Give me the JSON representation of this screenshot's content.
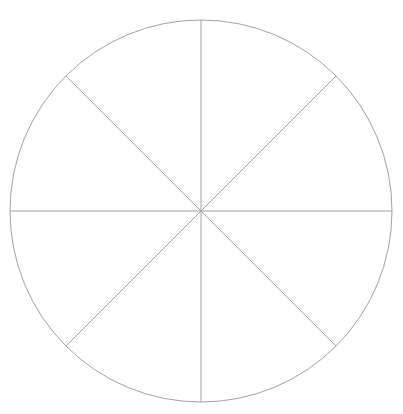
{
  "figure": {
    "name": "circle-eight-sectors",
    "caption_clipped": "Fig. 10.4   Eight equal sectors",
    "background_color": "#ffffff",
    "stroke_color": "#a2a2a8",
    "stroke_width": 1,
    "canvas": {
      "width": 403,
      "height": 414
    },
    "circle": {
      "label": "outer-circle",
      "center_x": 201,
      "center_y": 211,
      "radius": 191
    },
    "sector_count": 8,
    "sector_angle_degrees": 45,
    "diameters": [
      {
        "label": "vertical-diameter",
        "angle_degrees": 90,
        "x1": 201,
        "y1": 20,
        "x2": 201,
        "y2": 402
      },
      {
        "label": "horizontal-diameter",
        "angle_degrees": 0,
        "x1": 10,
        "y1": 211,
        "x2": 392,
        "y2": 211
      },
      {
        "label": "diagonal-diameter-45",
        "angle_degrees": 45,
        "x1": 336,
        "y1": 76,
        "x2": 66,
        "y2": 346
      },
      {
        "label": "diagonal-diameter-135",
        "angle_degrees": 135,
        "x1": 66,
        "y1": 76,
        "x2": 336,
        "y2": 346
      }
    ],
    "sector_endpoints": [
      {
        "label": "point-top",
        "x": 201,
        "y": 20
      },
      {
        "label": "point-upper-right",
        "x": 336,
        "y": 76
      },
      {
        "label": "point-right",
        "x": 392,
        "y": 211
      },
      {
        "label": "point-lower-right",
        "x": 336,
        "y": 346
      },
      {
        "label": "point-bottom",
        "x": 201,
        "y": 402
      },
      {
        "label": "point-lower-left",
        "x": 66,
        "y": 346
      },
      {
        "label": "point-left",
        "x": 10,
        "y": 211
      },
      {
        "label": "point-upper-left",
        "x": 66,
        "y": 76
      }
    ]
  }
}
